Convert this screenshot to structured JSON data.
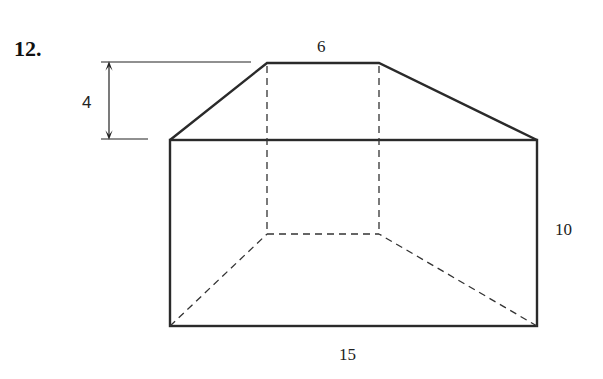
{
  "problem": {
    "number": "12."
  },
  "labels": {
    "top_width": "6",
    "height_roof": "4",
    "height_box": "10",
    "length": "15"
  },
  "colors": {
    "line": "#2a2a2a",
    "text": "#222222"
  }
}
